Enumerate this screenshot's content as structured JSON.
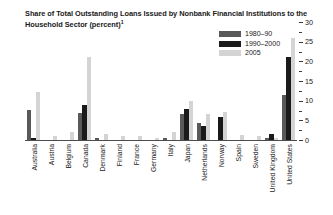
{
  "chart_data": {
    "type": "bar",
    "title": "Share of Total Outstanding Loans Issued by Nonbank Financial Institutions to the Household Sector (percent)",
    "title_line1": "Share of Total Outstanding Loans Issued by Nonbank Financial Institutions",
    "title_line2": "to the Household Sector (percent)",
    "title_footnote_marker": "1",
    "xlabel": "",
    "ylabel": "",
    "ylim": [
      0,
      30
    ],
    "yticks_major": [
      0,
      5,
      10,
      15,
      20,
      25,
      30
    ],
    "yticks_minor": [
      2.5,
      7.5,
      12.5,
      17.5,
      22.5,
      27.5
    ],
    "grid": false,
    "legend_position": "top-right",
    "axis_side": "right",
    "categories": [
      "Australia",
      "Austria",
      "Belgium",
      "Canada",
      "Denmark",
      "Finland",
      "France",
      "Germany",
      "Italy",
      "Japan",
      "Netherlands",
      "Norway",
      "Spain",
      "Sweden",
      "United Kingdom",
      "United States"
    ],
    "series": [
      {
        "name": "1980–90",
        "color": "#595959",
        "values": [
          7.6,
          0.0,
          0.0,
          6.9,
          0.4,
          0.0,
          0.0,
          0.0,
          0.4,
          6.5,
          4.4,
          0.0,
          0.0,
          0.0,
          0.5,
          11.5
        ]
      },
      {
        "name": "1990–2000",
        "color": "#1a1a1a",
        "values": [
          0.6,
          0.0,
          0.0,
          9.0,
          0.0,
          0.0,
          0.0,
          0.0,
          0.0,
          7.9,
          3.5,
          5.8,
          0.0,
          0.0,
          1.6,
          21.0
        ]
      },
      {
        "name": "2005",
        "color": "#d4d4d4",
        "values": [
          12.2,
          1.0,
          2.0,
          21.0,
          1.6,
          1.0,
          1.1,
          0.6,
          2.1,
          9.9,
          6.6,
          7.0,
          1.3,
          1.1,
          0.6,
          26.0
        ]
      }
    ]
  },
  "legend": {
    "items": [
      {
        "label": "1980–90",
        "color": "#595959"
      },
      {
        "label": "1990–2000",
        "color": "#1a1a1a"
      },
      {
        "label": "2005",
        "color": "#d4d4d4"
      }
    ]
  },
  "colors": {
    "series_1980_90": "#595959",
    "series_1990_2000": "#1a1a1a",
    "series_2005": "#d4d4d4",
    "axis": "#3a3a3a",
    "text": "#1a1a1a",
    "background": "#ffffff"
  }
}
